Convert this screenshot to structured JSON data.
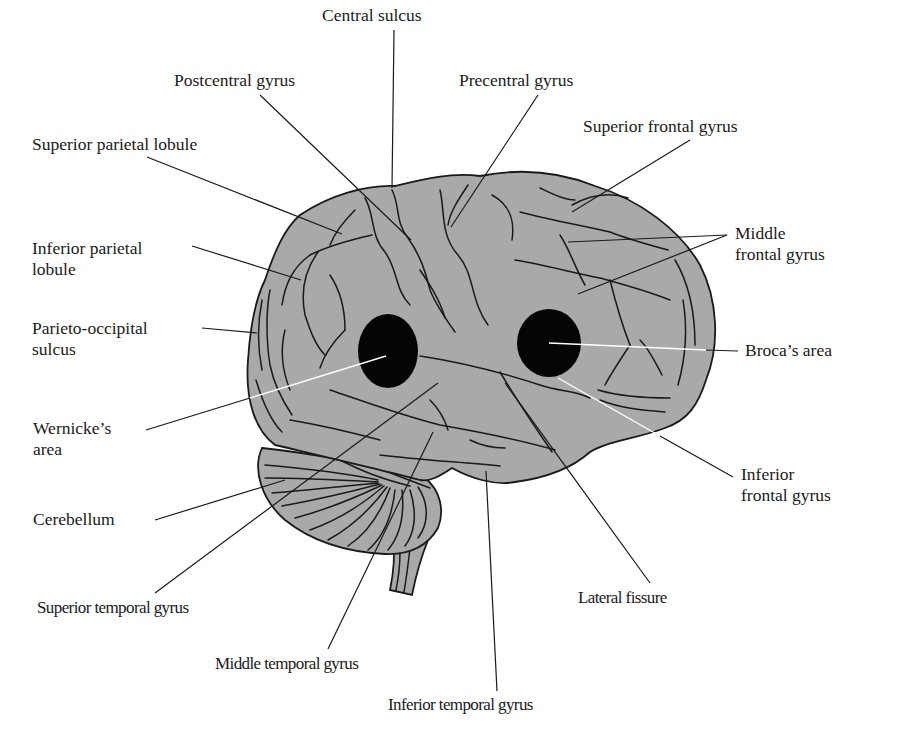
{
  "figure": {
    "colors": {
      "brain_fill": "#a9a9a9",
      "outline": "#1a1a1a",
      "language_areas": "#050505",
      "background": "#ffffff"
    }
  },
  "labels": {
    "central_sulcus": {
      "lines": [
        "Central sulcus"
      ]
    },
    "postcentral_gyrus": {
      "lines": [
        "Postcentral gyrus"
      ]
    },
    "precentral_gyrus": {
      "lines": [
        "Precentral gyrus"
      ]
    },
    "superior_frontal_gyrus": {
      "lines": [
        "Superior frontal gyrus"
      ]
    },
    "superior_parietal_lobule": {
      "lines": [
        "Superior parietal lobule"
      ]
    },
    "inferior_parietal_lobule": {
      "lines": [
        "Inferior parietal",
        "lobule"
      ]
    },
    "middle_frontal_gyrus": {
      "lines": [
        "Middle",
        "frontal gyrus"
      ]
    },
    "parieto_occipital_sulcus": {
      "lines": [
        "Parieto-occipital",
        "sulcus"
      ]
    },
    "brocas_area": {
      "lines": [
        "Broca’s area"
      ]
    },
    "wernickes_area": {
      "lines": [
        "Wernicke’s",
        "area"
      ]
    },
    "inferior_frontal_gyrus": {
      "lines": [
        "Inferior",
        "frontal gyrus"
      ]
    },
    "cerebellum": {
      "lines": [
        "Cerebellum"
      ]
    },
    "superior_temporal_gyrus": {
      "lines": [
        "Superior temporal gyrus"
      ]
    },
    "lateral_fissure": {
      "lines": [
        "Lateral fissure"
      ]
    },
    "middle_temporal_gyrus": {
      "lines": [
        "Middle temporal gyrus"
      ]
    },
    "inferior_temporal_gyrus": {
      "lines": [
        "Inferior temporal gyrus"
      ]
    }
  },
  "leader_lines": [
    {
      "label": "central_sulcus",
      "from": [
        394,
        30
      ],
      "to": [
        392,
        188
      ]
    },
    {
      "label": "postcentral_gyrus",
      "from": [
        260,
        95
      ],
      "to": [
        411,
        240
      ]
    },
    {
      "label": "precentral_gyrus",
      "from": [
        538,
        95
      ],
      "to": [
        451,
        227
      ]
    },
    {
      "label": "superior_frontal_gyrus",
      "from": [
        690,
        140
      ],
      "to": [
        572,
        212
      ]
    },
    {
      "label": "superior_parietal_lobule",
      "from": [
        147,
        157
      ],
      "to": [
        342,
        234
      ]
    },
    {
      "label": "inferior_parietal_lobule",
      "from": [
        192,
        246
      ],
      "to": [
        301,
        280
      ]
    },
    {
      "label": "middle_frontal_gyrus_a",
      "from": [
        727,
        235
      ],
      "to": [
        568,
        242
      ]
    },
    {
      "label": "middle_frontal_gyrus_b",
      "from": [
        727,
        235
      ],
      "to": [
        578,
        294
      ]
    },
    {
      "label": "parieto_occipital_sulcus",
      "from": [
        202,
        328
      ],
      "to": [
        257,
        333
      ]
    },
    {
      "label": "brocas_area",
      "from": [
        549,
        343
      ],
      "to": [
        738,
        351
      ],
      "style": "white-then-black"
    },
    {
      "label": "wernickes_area",
      "from": [
        146,
        430
      ],
      "to": [
        386,
        356
      ],
      "style": "white-then-black"
    },
    {
      "label": "inferior_frontal_gyrus",
      "from": [
        558,
        378
      ],
      "to": [
        733,
        477
      ],
      "style": "white-then-black"
    },
    {
      "label": "cerebellum",
      "from": [
        155,
        520
      ],
      "to": [
        285,
        480
      ]
    },
    {
      "label": "superior_temporal_gyrus",
      "from": [
        155,
        593
      ],
      "to": [
        438,
        383
      ]
    },
    {
      "label": "lateral_fissure",
      "from": [
        650,
        583
      ],
      "to": [
        505,
        383
      ]
    },
    {
      "label": "middle_temporal_gyrus",
      "from": [
        328,
        649
      ],
      "to": [
        433,
        432
      ]
    },
    {
      "label": "inferior_temporal_gyrus",
      "from": [
        497,
        691
      ],
      "to": [
        486,
        471
      ]
    }
  ],
  "regions": {
    "brocas_area": {
      "shape": "ellipse",
      "cx": 549,
      "cy": 343,
      "rx": 32,
      "ry": 34
    },
    "wernickes_area": {
      "shape": "ellipse",
      "cx": 388,
      "cy": 351,
      "rx": 30,
      "ry": 37
    }
  }
}
